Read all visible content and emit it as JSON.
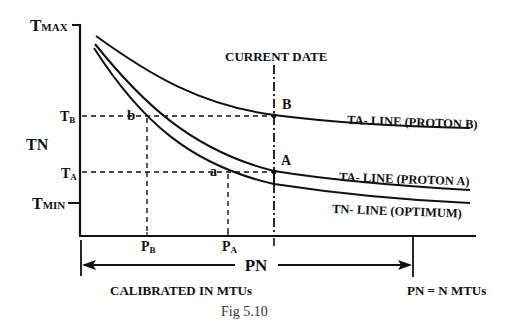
{
  "figure": {
    "caption": "Fig 5.10",
    "y_axis": {
      "label": "TN",
      "ticks": {
        "tmax": {
          "main": "T",
          "sub": "MAX"
        },
        "tb": {
          "main": "T",
          "sub": "B"
        },
        "ta": {
          "main": "T",
          "sub": "A"
        },
        "tmin": {
          "main": "T",
          "sub": "MIN"
        }
      }
    },
    "x_axis": {
      "ticks": {
        "pb": {
          "main": "P",
          "sub": "B"
        },
        "pa": {
          "main": "P",
          "sub": "A"
        }
      },
      "range_label": "PN",
      "calibration_label": "CALIBRATED IN MTUs",
      "equation_label": "PN = N MTUs"
    },
    "current_date_label": "CURRENT DATE",
    "points": {
      "B": "B",
      "A": "A",
      "b": "b",
      "a": "a"
    },
    "curves": {
      "proton_b": "TA- LINE (PROTON B)",
      "proton_a": "TA- LINE (PROTON A)",
      "optimum": "TN- LINE (OPTIMUM)"
    },
    "colors": {
      "ink": "#111111",
      "background": "#ffffff"
    }
  }
}
